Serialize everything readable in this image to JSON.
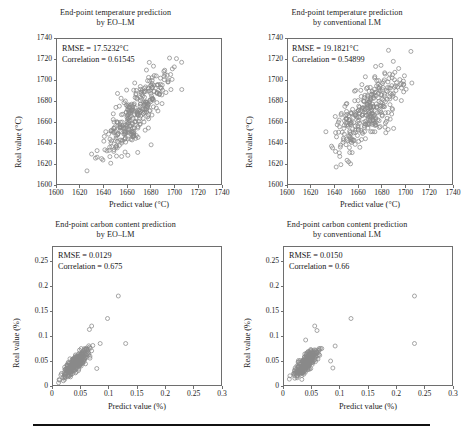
{
  "figure": {
    "background_color": "#ffffff",
    "marker_color": "#8a8a8a",
    "frame_color": "#6e6e6e",
    "text_color": "#1d1d1d",
    "caption_rule_color": "#111111"
  },
  "panels": [
    {
      "id": "top-left",
      "title_line1": "End-point temperature prediction",
      "title_line2": "by EO–LM",
      "rmse_label": "RMSE = 17.5232°C",
      "correlation_label": "Correlation = 0.61545",
      "xlabel": "Predict value (°C)",
      "ylabel": "Real value (°C)",
      "xticks": [
        "1600",
        "1620",
        "1640",
        "1660",
        "1680",
        "1700",
        "1720",
        "1740"
      ],
      "yticks": [
        "1600",
        "1620",
        "1640",
        "1660",
        "1680",
        "1700",
        "1720",
        "1740"
      ],
      "chart_data": {
        "type": "scatter",
        "title": "End-point temperature prediction by EO–LM",
        "xlabel": "Predict value (°C)",
        "ylabel": "Real value (°C)",
        "xlim": [
          1600,
          1740
        ],
        "ylim": [
          1600,
          1740
        ],
        "xticks": [
          1600,
          1620,
          1640,
          1660,
          1680,
          1700,
          1720,
          1740
        ],
        "yticks": [
          1600,
          1620,
          1640,
          1660,
          1680,
          1700,
          1720,
          1740
        ],
        "grid": false,
        "legend": null,
        "n_points": 330,
        "rmse": 17.5232,
        "correlation": 0.61545,
        "x_mean": 1668,
        "y_mean": 1669,
        "x_sd": 13.5,
        "y_sd": 20.5,
        "seed": 11
      }
    },
    {
      "id": "top-right",
      "title_line1": "End-point temperature prediction",
      "title_line2": "by conventional LM",
      "rmse_label": "RMSE = 19.1821°C",
      "correlation_label": "Correlation = 0.54899",
      "xlabel": "Predict value (°C)",
      "ylabel": "Real value (°C)",
      "xticks": [
        "1600",
        "1620",
        "1640",
        "1660",
        "1680",
        "1700",
        "1720",
        "1740"
      ],
      "yticks": [
        "1600",
        "1620",
        "1640",
        "1660",
        "1680",
        "1700",
        "1720",
        "1740"
      ],
      "chart_data": {
        "type": "scatter",
        "title": "End-point temperature prediction by conventional LM",
        "xlabel": "Predict value (°C)",
        "ylabel": "Real value (°C)",
        "xlim": [
          1600,
          1740
        ],
        "ylim": [
          1600,
          1740
        ],
        "xticks": [
          1600,
          1620,
          1640,
          1660,
          1680,
          1700,
          1720,
          1740
        ],
        "yticks": [
          1600,
          1620,
          1640,
          1660,
          1680,
          1700,
          1720,
          1740
        ],
        "grid": false,
        "legend": null,
        "n_points": 330,
        "rmse": 19.1821,
        "correlation": 0.54899,
        "x_mean": 1668,
        "y_mean": 1669,
        "x_sd": 15.5,
        "y_sd": 20.5,
        "seed": 29
      }
    },
    {
      "id": "bottom-left",
      "title_line1": "End-point carbon content prediction",
      "title_line2": "by EO–LM",
      "rmse_label": "RMSE = 0.0129",
      "correlation_label": "Correlation = 0.675",
      "xlabel": "Predict value (%)",
      "ylabel": "Real value (%)",
      "xticks": [
        "0",
        "0.05",
        "0.1",
        "0.15",
        "0.2",
        "0.25",
        "0.3"
      ],
      "yticks": [
        "0",
        "0.05",
        "0.1",
        "0.15",
        "0.2",
        "0.25"
      ],
      "chart_data": {
        "type": "scatter",
        "title": "End-point carbon content prediction by EO–LM",
        "xlabel": "Predict value (%)",
        "ylabel": "Real value (%)",
        "xlim": [
          0,
          0.3
        ],
        "ylim": [
          0,
          0.28
        ],
        "xticks": [
          0,
          0.05,
          0.1,
          0.15,
          0.2,
          0.25,
          0.3
        ],
        "yticks": [
          0,
          0.05,
          0.1,
          0.15,
          0.2,
          0.25
        ],
        "grid": false,
        "legend": null,
        "n_points": 330,
        "rmse": 0.0129,
        "correlation": 0.675,
        "x_mean": 0.042,
        "y_mean": 0.046,
        "x_sd": 0.0105,
        "y_sd": 0.0135,
        "seed": 7,
        "outliers": [
          [
            0.117,
            0.18
          ],
          [
            0.098,
            0.135
          ],
          [
            0.07,
            0.12
          ],
          [
            0.066,
            0.113
          ],
          [
            0.13,
            0.085
          ],
          [
            0.085,
            0.085
          ],
          [
            0.079,
            0.035
          ]
        ]
      }
    },
    {
      "id": "bottom-right",
      "title_line1": "End-point carbon content prediction",
      "title_line2": "by conventional LM",
      "rmse_label": "RMSE = 0.0150",
      "correlation_label": "Correlation = 0.66",
      "xlabel": "Predict value (%)",
      "ylabel": "Real value (%)",
      "xticks": [
        "0",
        "0.05",
        "0.1",
        "0.15",
        "0.2",
        "0.25",
        "0.3"
      ],
      "yticks": [
        "0",
        "0.05",
        "0.1",
        "0.15",
        "0.2",
        "0.25"
      ],
      "chart_data": {
        "type": "scatter",
        "title": "End-point carbon content prediction by conventional LM",
        "xlabel": "Predict value (%)",
        "ylabel": "Real value (%)",
        "xlim": [
          0,
          0.3
        ],
        "ylim": [
          0,
          0.28
        ],
        "xticks": [
          0,
          0.05,
          0.1,
          0.15,
          0.2,
          0.25,
          0.3
        ],
        "yticks": [
          0,
          0.05,
          0.1,
          0.15,
          0.2,
          0.25
        ],
        "grid": false,
        "legend": null,
        "n_points": 330,
        "rmse": 0.015,
        "correlation": 0.66,
        "x_mean": 0.041,
        "y_mean": 0.046,
        "x_sd": 0.01,
        "y_sd": 0.013,
        "seed": 53,
        "outliers": [
          [
            0.232,
            0.18
          ],
          [
            0.12,
            0.135
          ],
          [
            0.232,
            0.085
          ],
          [
            0.056,
            0.12
          ],
          [
            0.06,
            0.111
          ],
          [
            0.04,
            0.092
          ],
          [
            0.092,
            0.08
          ],
          [
            0.084,
            0.05
          ],
          [
            0.088,
            0.036
          ]
        ]
      }
    }
  ]
}
